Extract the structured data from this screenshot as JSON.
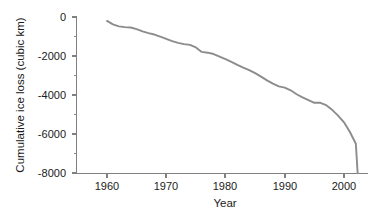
{
  "chart_data": {
    "type": "line",
    "title": "",
    "xlabel": "Year",
    "ylabel": "Cumulative ice loss (cubic km)",
    "xlim": [
      1954,
      2005
    ],
    "ylim": [
      -8000,
      0
    ],
    "grid": false,
    "legend": null,
    "series_color": "#8c8c8c",
    "axis_color": "#808080",
    "xticks": [
      1960,
      1970,
      1980,
      1990,
      2000
    ],
    "xtick_labels": [
      "1960",
      "1970",
      "1980",
      "1990",
      "2000"
    ],
    "yticks": [
      0,
      -2000,
      -4000,
      -6000,
      -8000
    ],
    "ytick_labels": [
      "0",
      "-2000",
      "-4000",
      "-6000",
      "-8000"
    ],
    "yticks_minor": [
      -1000,
      -3000,
      -5000,
      -7000
    ],
    "x": [
      1960,
      1961,
      1962,
      1963,
      1964,
      1965,
      1966,
      1967,
      1968,
      1969,
      1970,
      1971,
      1972,
      1973,
      1974,
      1975,
      1976,
      1977,
      1978,
      1979,
      1980,
      1981,
      1982,
      1983,
      1984,
      1985,
      1986,
      1987,
      1988,
      1989,
      1990,
      1991,
      1992,
      1993,
      1994,
      1995,
      1996,
      1997,
      1998,
      1999,
      2000,
      2001,
      2002
    ],
    "values": [
      -200,
      -380,
      -480,
      -520,
      -540,
      -620,
      -740,
      -830,
      -900,
      -1010,
      -1120,
      -1240,
      -1330,
      -1390,
      -1430,
      -1560,
      -1790,
      -1830,
      -1900,
      -2030,
      -2160,
      -2300,
      -2450,
      -2600,
      -2720,
      -2880,
      -3060,
      -3250,
      -3420,
      -3560,
      -3620,
      -3760,
      -3960,
      -4120,
      -4260,
      -4400,
      -4400,
      -4520,
      -4760,
      -5060,
      -5400,
      -5900,
      -6500
    ],
    "values_tail_note": "curve continues steeply to -8000 by 2002"
  },
  "axes": {
    "x_axis_name": "year-axis",
    "y_axis_name": "cumulative-ice-loss-axis"
  }
}
